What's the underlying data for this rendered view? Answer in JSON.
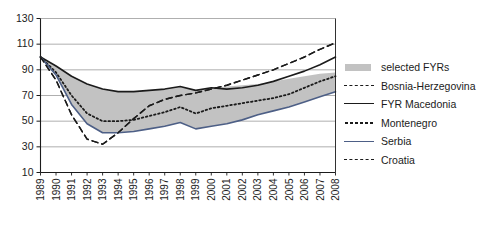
{
  "chart_data": {
    "type": "line",
    "title": "",
    "subtitle": "",
    "xlabel": "",
    "ylabel": "",
    "grid": true,
    "legend_position": "right",
    "xlim": [
      1989,
      2008
    ],
    "ylim": [
      10,
      130
    ],
    "yticks": [
      10,
      30,
      50,
      70,
      90,
      110,
      130
    ],
    "categories": [
      "1989",
      "1990",
      "1991",
      "1992",
      "1993",
      "1994",
      "1995",
      "1996",
      "1997",
      "1998",
      "1999",
      "2000",
      "2001",
      "2002",
      "2003",
      "2004",
      "2005",
      "2006",
      "2007",
      "2008"
    ],
    "band": {
      "name": "selected FYRs",
      "color": "#c2c2c2",
      "upper": [
        100,
        93,
        85,
        79,
        75,
        73,
        73,
        74,
        75,
        77,
        74,
        76,
        77,
        78,
        79,
        81,
        83,
        85,
        87,
        88
      ],
      "lower": [
        100,
        86,
        63,
        48,
        41,
        41,
        42,
        44,
        46,
        49,
        44,
        46,
        48,
        51,
        55,
        58,
        61,
        65,
        69,
        73
      ]
    },
    "series": [
      {
        "name": "Bosnia-Herzegovina",
        "style": "dashed",
        "color": "#1b1b1b",
        "values": [
          100,
          82,
          55,
          36,
          32,
          41,
          52,
          62,
          67,
          70,
          72,
          75,
          78,
          82,
          86,
          90,
          95,
          100,
          106,
          111
        ]
      },
      {
        "name": "FYR Macedonia",
        "style": "solid",
        "color": "#1b1b1b",
        "values": [
          100,
          93,
          85,
          79,
          75,
          73,
          73,
          74,
          75,
          77,
          74,
          76,
          75,
          76,
          78,
          81,
          85,
          89,
          94,
          100
        ]
      },
      {
        "name": "Montenegro",
        "style": "dotted",
        "color": "#1b1b1b",
        "values": [
          100,
          88,
          70,
          56,
          50,
          50,
          51,
          54,
          57,
          61,
          56,
          60,
          62,
          64,
          66,
          68,
          71,
          76,
          81,
          85
        ]
      },
      {
        "name": "Serbia",
        "style": "solid",
        "color": "#4d5f86",
        "values": [
          100,
          86,
          63,
          48,
          41,
          41,
          42,
          44,
          46,
          49,
          44,
          46,
          48,
          51,
          55,
          58,
          61,
          65,
          69,
          73
        ]
      },
      {
        "name": "Croatia",
        "style": "dashed",
        "color": "#1b1b1b",
        "values": [
          100,
          82,
          55,
          36,
          32,
          41,
          52,
          62,
          67,
          70,
          72,
          75,
          78,
          82,
          86,
          90,
          95,
          100,
          106,
          111
        ]
      }
    ]
  },
  "legend": {
    "items": [
      {
        "label": "selected FYRs",
        "key": "band"
      },
      {
        "label": "Bosnia-Herzegovina",
        "key": "dash-long"
      },
      {
        "label": "FYR Macedonia",
        "key": "solid"
      },
      {
        "label": "Montenegro",
        "key": "dotted"
      },
      {
        "label": "Serbia",
        "key": "serbia"
      },
      {
        "label": "Croatia",
        "key": "dash-long"
      }
    ]
  }
}
